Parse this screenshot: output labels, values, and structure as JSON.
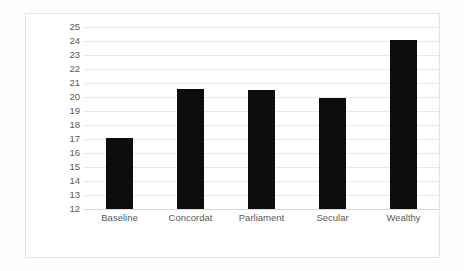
{
  "chart_data": {
    "type": "bar",
    "title": "",
    "xlabel": "",
    "ylabel": "Years as monarch",
    "categories": [
      "Baseline",
      "Concordat",
      "Parliament",
      "Secular",
      "Wealthy"
    ],
    "values": [
      17.1,
      20.6,
      20.5,
      19.9,
      24.1
    ],
    "ylim": [
      12,
      25
    ],
    "ytick_step": 1,
    "yticks": [
      25,
      24,
      23,
      22,
      21,
      20,
      19,
      18,
      17,
      16,
      15,
      14,
      13,
      12
    ],
    "ytick_labels": [
      "25",
      "24",
      "23",
      "22",
      "21",
      "20",
      "19",
      "18",
      "17",
      "16",
      "15",
      "14",
      "13",
      "12"
    ],
    "grid": true,
    "grid_axis": "y",
    "legend": false,
    "legend_position": "none",
    "bar_color": "#0d0d0d",
    "grid_color": "#e8e8e8",
    "text_color": "#595959",
    "plot_background": "#ffffff",
    "frame_color": "#e3e3e3"
  }
}
